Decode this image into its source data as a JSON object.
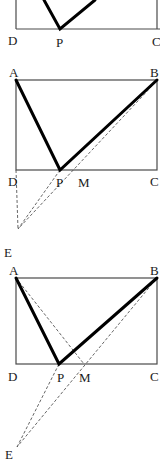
{
  "figures": [
    {
      "id": "figure-1",
      "labels": {
        "D": "D",
        "P": "P",
        "C": "C"
      },
      "points": {
        "D": [
          16,
          29
        ],
        "C": [
          160,
          29
        ],
        "P": [
          60,
          29
        ],
        "topLeftLineEnd": [
          44,
          0
        ],
        "topRightLineEnd": [
          95,
          0
        ]
      }
    },
    {
      "id": "figure-2",
      "labels": {
        "A": "A",
        "B": "B",
        "C": "C",
        "D": "D",
        "P": "P",
        "M": "M",
        "E": "E"
      },
      "points": {
        "A": [
          16,
          80
        ],
        "B": [
          157,
          80
        ],
        "C": [
          157,
          170
        ],
        "D": [
          16,
          170
        ],
        "P": [
          60,
          170
        ],
        "M": [
          85,
          170
        ],
        "E": [
          18,
          229
        ]
      }
    },
    {
      "id": "figure-3",
      "labels": {
        "A": "A",
        "B": "B",
        "C": "C",
        "D": "D",
        "P": "P",
        "M": "M",
        "E": "E"
      },
      "points": {
        "A": [
          16,
          278
        ],
        "B": [
          157,
          278
        ],
        "C": [
          157,
          364
        ],
        "D": [
          16,
          364
        ],
        "P": [
          59,
          364
        ],
        "M": [
          84,
          364
        ],
        "E": [
          17,
          447
        ]
      }
    }
  ]
}
